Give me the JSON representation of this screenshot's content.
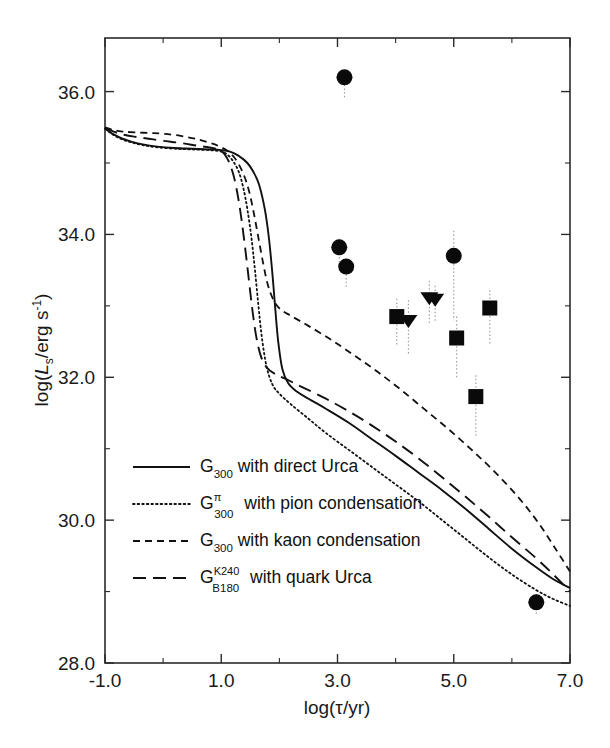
{
  "figure": {
    "background_color": "#ffffff",
    "ink_color": "#111111"
  },
  "chart_data": {
    "type": "line",
    "title": "",
    "subtitle": "",
    "xlabel": "log(τ/yr)",
    "ylabel": "log(Lₛ/erg s⁻¹)",
    "xlim": [
      -1.0,
      7.0
    ],
    "ylim": [
      28.0,
      36.75
    ],
    "grid": false,
    "legend_position": "lower-left-inside",
    "x_ticks": [
      -1.0,
      1.0,
      3.0,
      5.0,
      7.0
    ],
    "x_tick_labels": [
      "-1.0",
      "1.0",
      "3.0",
      "5.0",
      "7.0"
    ],
    "x_minor_ticks": [
      0.0,
      2.0,
      4.0,
      6.0
    ],
    "y_ticks": [
      28.0,
      30.0,
      32.0,
      34.0,
      36.0
    ],
    "y_tick_labels": [
      "28.0",
      "30.0",
      "32.0",
      "34.0",
      "36.0"
    ],
    "y_minor_ticks": [
      29.0,
      31.0,
      33.0,
      35.0
    ],
    "series": [
      {
        "name": "G300 with direct Urca",
        "style": "solid",
        "legend_label_base": "G",
        "legend_label_sub": "300",
        "legend_label_sup": "",
        "legend_label_rest": "with direct Urca",
        "points": [
          [
            -1.0,
            35.48
          ],
          [
            -0.85,
            35.4
          ],
          [
            -0.7,
            35.34
          ],
          [
            -0.55,
            35.3
          ],
          [
            -0.35,
            35.26
          ],
          [
            -0.1,
            35.23
          ],
          [
            0.2,
            35.21
          ],
          [
            0.5,
            35.2
          ],
          [
            0.8,
            35.19
          ],
          [
            1.0,
            35.18
          ],
          [
            1.15,
            35.16
          ],
          [
            1.3,
            35.1
          ],
          [
            1.45,
            35.0
          ],
          [
            1.55,
            34.88
          ],
          [
            1.65,
            34.7
          ],
          [
            1.75,
            34.35
          ],
          [
            1.82,
            33.95
          ],
          [
            1.88,
            33.45
          ],
          [
            1.93,
            32.95
          ],
          [
            1.98,
            32.5
          ],
          [
            2.05,
            32.12
          ],
          [
            2.15,
            31.92
          ],
          [
            2.3,
            31.8
          ],
          [
            2.5,
            31.7
          ],
          [
            2.8,
            31.56
          ],
          [
            3.2,
            31.36
          ],
          [
            3.6,
            31.13
          ],
          [
            4.0,
            30.9
          ],
          [
            4.4,
            30.66
          ],
          [
            4.8,
            30.42
          ],
          [
            5.2,
            30.16
          ],
          [
            5.6,
            29.88
          ],
          [
            6.0,
            29.6
          ],
          [
            6.4,
            29.35
          ],
          [
            6.7,
            29.18
          ],
          [
            7.0,
            29.05
          ]
        ]
      },
      {
        "name": "G300 pi with pion condensation",
        "style": "dotted",
        "legend_label_base": "G",
        "legend_label_sub": "300",
        "legend_label_sup": "π",
        "legend_label_rest": "with pion condensation",
        "points": [
          [
            -1.0,
            35.48
          ],
          [
            -0.85,
            35.39
          ],
          [
            -0.7,
            35.33
          ],
          [
            -0.55,
            35.29
          ],
          [
            -0.35,
            35.25
          ],
          [
            -0.1,
            35.22
          ],
          [
            0.2,
            35.2
          ],
          [
            0.5,
            35.19
          ],
          [
            0.8,
            35.18
          ],
          [
            1.0,
            35.16
          ],
          [
            1.1,
            35.12
          ],
          [
            1.2,
            35.03
          ],
          [
            1.3,
            34.88
          ],
          [
            1.38,
            34.65
          ],
          [
            1.45,
            34.35
          ],
          [
            1.52,
            33.95
          ],
          [
            1.58,
            33.5
          ],
          [
            1.64,
            33.0
          ],
          [
            1.7,
            32.55
          ],
          [
            1.78,
            32.15
          ],
          [
            1.88,
            31.9
          ],
          [
            2.0,
            31.77
          ],
          [
            2.2,
            31.62
          ],
          [
            2.5,
            31.42
          ],
          [
            2.8,
            31.22
          ],
          [
            3.2,
            30.98
          ],
          [
            3.6,
            30.74
          ],
          [
            4.0,
            30.5
          ],
          [
            4.4,
            30.26
          ],
          [
            4.8,
            30.0
          ],
          [
            5.2,
            29.74
          ],
          [
            5.6,
            29.48
          ],
          [
            6.0,
            29.24
          ],
          [
            6.4,
            29.03
          ],
          [
            6.7,
            28.9
          ],
          [
            7.0,
            28.8
          ]
        ]
      },
      {
        "name": "G300 with kaon condensation",
        "style": "dashed",
        "legend_label_base": "G",
        "legend_label_sub": "300",
        "legend_label_sup": "",
        "legend_label_rest": "with kaon condensation",
        "points": [
          [
            -1.0,
            35.5
          ],
          [
            -0.85,
            35.46
          ],
          [
            -0.7,
            35.44
          ],
          [
            -0.5,
            35.43
          ],
          [
            -0.25,
            35.42
          ],
          [
            0.0,
            35.41
          ],
          [
            0.3,
            35.38
          ],
          [
            0.6,
            35.33
          ],
          [
            0.85,
            35.27
          ],
          [
            1.0,
            35.22
          ],
          [
            1.12,
            35.16
          ],
          [
            1.25,
            35.05
          ],
          [
            1.38,
            34.85
          ],
          [
            1.48,
            34.6
          ],
          [
            1.56,
            34.3
          ],
          [
            1.64,
            33.95
          ],
          [
            1.72,
            33.6
          ],
          [
            1.8,
            33.3
          ],
          [
            1.9,
            33.08
          ],
          [
            2.02,
            32.95
          ],
          [
            2.2,
            32.86
          ],
          [
            2.5,
            32.72
          ],
          [
            2.9,
            32.52
          ],
          [
            3.3,
            32.3
          ],
          [
            3.7,
            32.07
          ],
          [
            4.1,
            31.82
          ],
          [
            4.5,
            31.55
          ],
          [
            4.9,
            31.28
          ],
          [
            5.3,
            30.99
          ],
          [
            5.7,
            30.68
          ],
          [
            6.1,
            30.33
          ],
          [
            6.45,
            29.97
          ],
          [
            6.75,
            29.6
          ],
          [
            7.0,
            29.28
          ]
        ]
      },
      {
        "name": "G B180 K240 with quark Urca",
        "style": "longdash",
        "legend_label_base": "G",
        "legend_label_sub": "B180",
        "legend_label_sup": "K240",
        "legend_label_rest": "with quark Urca",
        "points": [
          [
            -1.0,
            35.49
          ],
          [
            -0.85,
            35.44
          ],
          [
            -0.7,
            35.4
          ],
          [
            -0.5,
            35.37
          ],
          [
            -0.25,
            35.34
          ],
          [
            0.0,
            35.31
          ],
          [
            0.3,
            35.28
          ],
          [
            0.6,
            35.24
          ],
          [
            0.85,
            35.21
          ],
          [
            0.98,
            35.18
          ],
          [
            1.06,
            35.12
          ],
          [
            1.14,
            35.0
          ],
          [
            1.22,
            34.8
          ],
          [
            1.29,
            34.52
          ],
          [
            1.35,
            34.2
          ],
          [
            1.41,
            33.82
          ],
          [
            1.47,
            33.4
          ],
          [
            1.53,
            32.98
          ],
          [
            1.6,
            32.58
          ],
          [
            1.68,
            32.3
          ],
          [
            1.78,
            32.14
          ],
          [
            1.92,
            32.05
          ],
          [
            2.1,
            31.98
          ],
          [
            2.4,
            31.86
          ],
          [
            2.8,
            31.7
          ],
          [
            3.2,
            31.52
          ],
          [
            3.6,
            31.32
          ],
          [
            4.0,
            31.1
          ],
          [
            4.4,
            30.86
          ],
          [
            4.8,
            30.6
          ],
          [
            5.2,
            30.33
          ],
          [
            5.6,
            30.05
          ],
          [
            6.0,
            29.76
          ],
          [
            6.4,
            29.48
          ],
          [
            6.7,
            29.25
          ],
          [
            7.0,
            29.0
          ]
        ]
      }
    ],
    "observations": [
      {
        "marker": "circle",
        "x": 3.12,
        "y": 36.2,
        "err_low": 0.3,
        "err_high": 0.0
      },
      {
        "marker": "circle",
        "x": 3.03,
        "y": 33.82,
        "err_low": 0.22,
        "err_high": 0.12
      },
      {
        "marker": "circle",
        "x": 3.15,
        "y": 33.55,
        "err_low": 0.3,
        "err_high": 0.1
      },
      {
        "marker": "circle",
        "x": 5.0,
        "y": 33.7,
        "err_low": 0.9,
        "err_high": 0.35
      },
      {
        "marker": "circle",
        "x": 6.42,
        "y": 28.85,
        "err_low": 0.18,
        "err_high": 0.12
      },
      {
        "marker": "triangle-down",
        "x": 4.58,
        "y": 33.1,
        "err_low": 0.35,
        "err_high": 0.25
      },
      {
        "marker": "triangle-down",
        "x": 4.68,
        "y": 33.08,
        "err_low": 0.3,
        "err_high": 0.2
      },
      {
        "marker": "triangle-down",
        "x": 4.22,
        "y": 32.78,
        "err_low": 0.45,
        "err_high": 0.3
      },
      {
        "marker": "square",
        "x": 4.02,
        "y": 32.85,
        "err_low": 0.4,
        "err_high": 0.25
      },
      {
        "marker": "square",
        "x": 5.05,
        "y": 32.55,
        "err_low": 0.55,
        "err_high": 0.3
      },
      {
        "marker": "square",
        "x": 5.62,
        "y": 32.97,
        "err_low": 0.5,
        "err_high": 0.25
      },
      {
        "marker": "square",
        "x": 5.38,
        "y": 31.73,
        "err_low": 0.55,
        "err_high": 0.3
      }
    ],
    "legend": [
      {
        "style": "solid",
        "base": "G",
        "sub": "300",
        "sup": "",
        "text": "with direct Urca"
      },
      {
        "style": "dotted",
        "base": "G",
        "sub": "300",
        "sup": "π",
        "text": "with pion condensation"
      },
      {
        "style": "dashed",
        "base": "G",
        "sub": "300",
        "sup": "",
        "text": "with kaon condensation"
      },
      {
        "style": "longdash",
        "base": "G",
        "sub": "B180",
        "sup": "K240",
        "text": "with quark Urca"
      }
    ]
  }
}
